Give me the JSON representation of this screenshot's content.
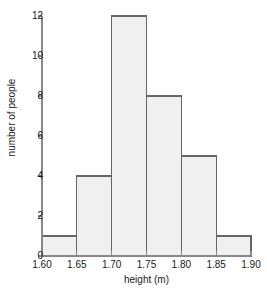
{
  "chart_data": {
    "type": "bar",
    "title": "",
    "subtitle": "",
    "xlabel": "height (m)",
    "ylabel": "number of people",
    "grid": false,
    "legend": null,
    "bin_edges": [
      1.6,
      1.65,
      1.7,
      1.75,
      1.8,
      1.85,
      1.9
    ],
    "categories": [
      "1.60-1.65",
      "1.65-1.70",
      "1.70-1.75",
      "1.75-1.80",
      "1.80-1.85",
      "1.85-1.90"
    ],
    "values": [
      1,
      4,
      12,
      8,
      5,
      1
    ],
    "bars": [
      {
        "x0": 1.6,
        "x1": 1.65,
        "value": 1
      },
      {
        "x0": 1.65,
        "x1": 1.7,
        "value": 4
      },
      {
        "x0": 1.7,
        "x1": 1.75,
        "value": 12
      },
      {
        "x0": 1.75,
        "x1": 1.8,
        "value": 8
      },
      {
        "x0": 1.8,
        "x1": 1.85,
        "value": 5
      },
      {
        "x0": 1.85,
        "x1": 1.9,
        "value": 1
      }
    ],
    "xlim": [
      1.6,
      1.9
    ],
    "ylim": [
      0,
      12
    ],
    "xticks": [
      1.6,
      1.65,
      1.7,
      1.75,
      1.8,
      1.85,
      1.9
    ],
    "xtick_labels": [
      "1.60",
      "1.65",
      "1.70",
      "1.75",
      "1.80",
      "1.85",
      "1.90"
    ],
    "yticks": [
      0,
      2,
      4,
      6,
      8,
      10,
      12
    ],
    "ytick_labels": [
      "0",
      "2",
      "4",
      "6",
      "8",
      "10",
      "12"
    ],
    "colors": {
      "bar_fill": "#f0f0f0",
      "bar_stroke": "#666666",
      "axis": "#888888",
      "text": "#1a1a1a",
      "background": "#ffffff"
    }
  }
}
